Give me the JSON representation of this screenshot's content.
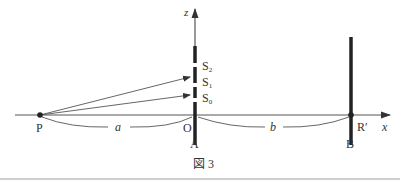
{
  "figure": {
    "caption": "図 3",
    "axes": {
      "x_label": "x",
      "z_label": "z"
    },
    "points": {
      "source": "P",
      "origin": "O",
      "screen_b_point": "R′"
    },
    "slits": [
      {
        "label": "S",
        "sub": "2"
      },
      {
        "label": "S",
        "sub": "1"
      },
      {
        "label": "S",
        "sub": "0"
      }
    ],
    "screens": {
      "first": "A",
      "second": "B"
    },
    "distances": {
      "P_to_O": "a",
      "O_to_R": "b"
    },
    "colors": {
      "line": "#333333",
      "thin_line": "#555555"
    }
  }
}
